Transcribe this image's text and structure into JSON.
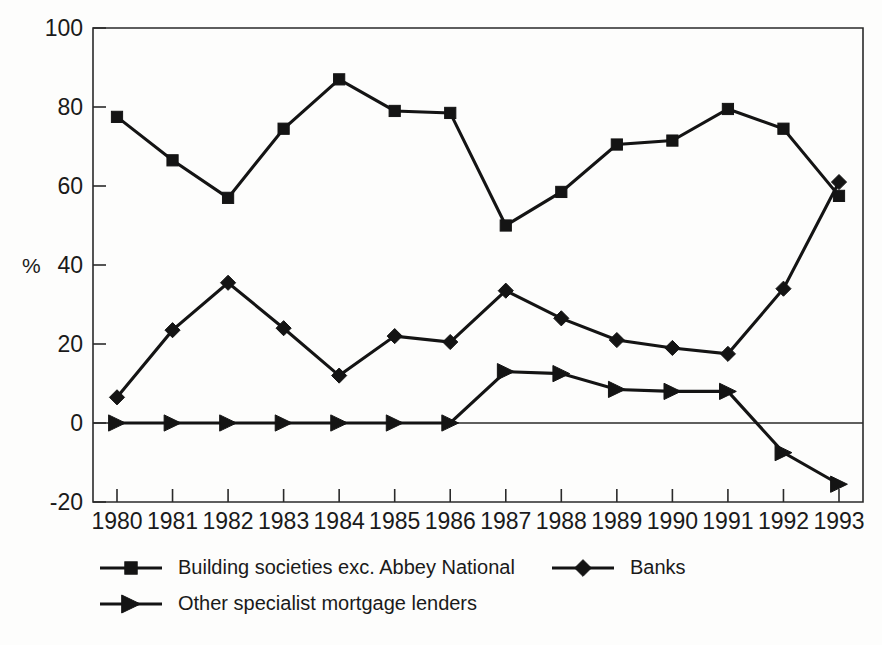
{
  "chart_data": {
    "type": "line",
    "title": "",
    "subtitle": "",
    "xlabel": "",
    "ylabel": "%",
    "categories": [
      "1980",
      "1981",
      "1982",
      "1983",
      "1984",
      "1985",
      "1986",
      "1987",
      "1988",
      "1989",
      "1990",
      "1991",
      "1992",
      "1993"
    ],
    "x": [
      1980,
      1981,
      1982,
      1983,
      1984,
      1985,
      1986,
      1987,
      1988,
      1989,
      1990,
      1991,
      1992,
      1993
    ],
    "ylim": [
      -20,
      100
    ],
    "xlim": [
      1980,
      1993
    ],
    "yticks": [
      -20,
      0,
      20,
      40,
      60,
      80,
      100
    ],
    "ytick_labels": [
      "-20",
      "0",
      "20",
      "40",
      "60",
      "80",
      "100"
    ],
    "grid": false,
    "legend_position": "below-axes",
    "series": [
      {
        "name": "Building societies exc. Abbey National",
        "marker": "square",
        "color": "#141414",
        "values": [
          77.5,
          66.5,
          57.0,
          74.5,
          87.0,
          79.0,
          78.5,
          50.0,
          58.5,
          70.5,
          71.5,
          79.5,
          74.5,
          57.5
        ]
      },
      {
        "name": "Banks",
        "marker": "diamond",
        "color": "#141414",
        "values": [
          6.5,
          23.5,
          35.5,
          24.0,
          12.0,
          22.0,
          20.5,
          33.5,
          26.5,
          21.0,
          19.0,
          17.5,
          34.0,
          61.0
        ]
      },
      {
        "name": "Other specialist mortgage lenders",
        "marker": "triangle-right",
        "color": "#141414",
        "values": [
          0.0,
          0.0,
          0.0,
          0.0,
          0.0,
          0.0,
          0.0,
          13.0,
          12.5,
          8.5,
          8.0,
          8.0,
          -7.5,
          -15.5
        ]
      }
    ],
    "legend": [
      {
        "label": "Building societies exc. Abbey National",
        "marker": "square"
      },
      {
        "label": "Banks",
        "marker": "diamond"
      },
      {
        "label": "Other specialist mortgage lenders",
        "marker": "triangle-right"
      }
    ]
  },
  "colors": {
    "ink": "#141414",
    "axis": "#2a2a2a",
    "background": "#fdfdfc"
  }
}
